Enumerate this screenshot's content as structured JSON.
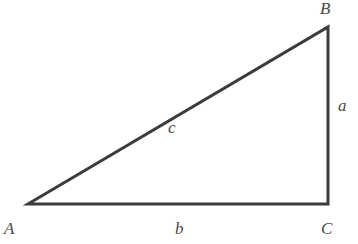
{
  "diagram": {
    "type": "right-triangle",
    "stroke_color": "#3c3c3c",
    "label_color": "#4a4a4a",
    "vertices": {
      "A": {
        "label": "A",
        "x": 28,
        "y": 204
      },
      "B": {
        "label": "B",
        "x": 328,
        "y": 27
      },
      "C": {
        "label": "C",
        "x": 328,
        "y": 204
      }
    },
    "sides": {
      "a": {
        "label": "a",
        "from": "B",
        "to": "C"
      },
      "b": {
        "label": "b",
        "from": "A",
        "to": "C"
      },
      "c": {
        "label": "c",
        "from": "A",
        "to": "B"
      }
    }
  }
}
